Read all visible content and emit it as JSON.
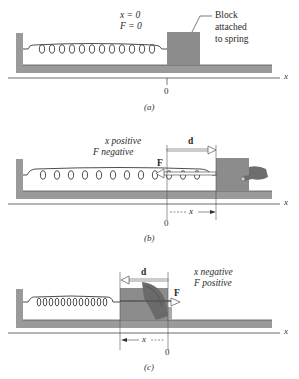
{
  "figure": {
    "panels": [
      {
        "id": "a",
        "caption": "(a)",
        "state_line1": "x = 0",
        "state_line2": "F = 0",
        "block_label": [
          "Block",
          "attached",
          "to spring"
        ],
        "origin_tick": "0",
        "axis_label": "x"
      },
      {
        "id": "b",
        "caption": "(b)",
        "state_line1": "x  positive",
        "state_line2": "F  negative",
        "force_label": "F",
        "displacement_label": "d",
        "x_measure_label": "x",
        "origin_tick": "0",
        "axis_label": "x"
      },
      {
        "id": "c",
        "caption": "(c)",
        "state_line1": "x  negative",
        "state_line2": "F  positive",
        "force_label": "F",
        "displacement_label": "d",
        "x_measure_label": "x",
        "origin_tick": "0",
        "axis_label": "x"
      }
    ]
  },
  "colors": {
    "wall_floor": "#9a9a9a",
    "block": "#8c8c8c",
    "spring": "#3a3a3a",
    "arrow_outline": "#555555",
    "hand": "#6e6e6e"
  }
}
